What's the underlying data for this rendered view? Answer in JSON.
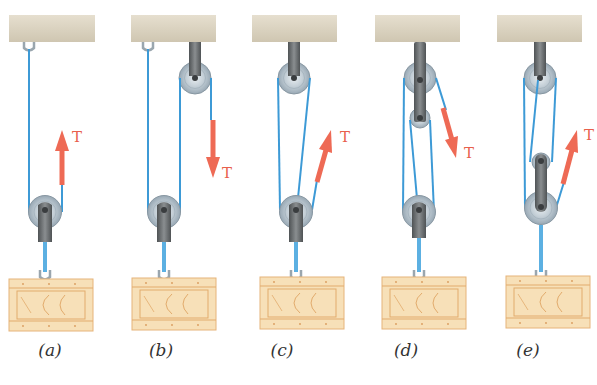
{
  "figure": {
    "panels": [
      {
        "id": "a",
        "caption": "(a)",
        "force_label": "T",
        "force_direction": "up"
      },
      {
        "id": "b",
        "caption": "(b)",
        "force_label": "T",
        "force_direction": "down"
      },
      {
        "id": "c",
        "caption": "(c)",
        "force_label": "T",
        "force_direction": "up-right"
      },
      {
        "id": "d",
        "caption": "(d)",
        "force_label": "T",
        "force_direction": "down-right"
      },
      {
        "id": "e",
        "caption": "(e)",
        "force_label": "T",
        "force_direction": "up-right"
      }
    ],
    "colors": {
      "rope": "#3d9ad6",
      "force_arrow": "#ee6a55",
      "ceiling": "#dcd5c4",
      "pulley": "#b9c6cf",
      "bracket": "#5f6365",
      "crate": "#f6deb4",
      "crate_lines": "#e0a867"
    }
  }
}
